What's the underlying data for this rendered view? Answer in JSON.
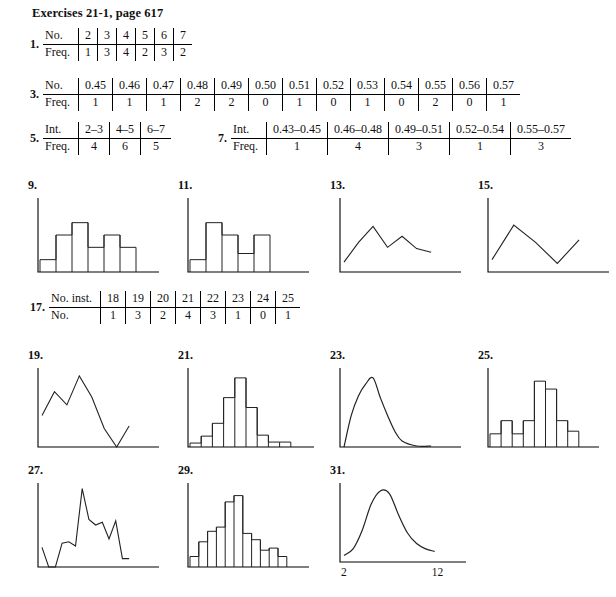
{
  "header": {
    "title": "Exercises 21-1, page 617"
  },
  "tables": [
    {
      "number": "1.",
      "x": 30,
      "y": 28,
      "rows": [
        {
          "label": "No.",
          "cells": [
            "2",
            "3",
            "4",
            "5",
            "6",
            "7"
          ]
        },
        {
          "label": "Freq.",
          "cells": [
            "1",
            "3",
            "4",
            "2",
            "3",
            "2"
          ]
        }
      ]
    },
    {
      "number": "3.",
      "x": 30,
      "y": 78,
      "rows": [
        {
          "label": "No.",
          "cells": [
            "0.45",
            "0.46",
            "0.47",
            "0.48",
            "0.49",
            "0.50",
            "0.51",
            "0.52",
            "0.53",
            "0.54",
            "0.55",
            "0.56",
            "0.57"
          ]
        },
        {
          "label": "Freq.",
          "cells": [
            "1",
            "1",
            "1",
            "2",
            "2",
            "0",
            "1",
            "0",
            "1",
            "0",
            "2",
            "0",
            "1"
          ]
        }
      ]
    },
    {
      "number": "5.",
      "x": 30,
      "y": 122,
      "rows": [
        {
          "label": "Int.",
          "cells": [
            "2–3",
            "4–5",
            "6–7"
          ]
        },
        {
          "label": "Freq.",
          "cells": [
            "4",
            "6",
            "5"
          ]
        }
      ]
    },
    {
      "number": "7.",
      "x": 218,
      "y": 122,
      "rows": [
        {
          "label": "Int.",
          "cells": [
            "0.43–0.45",
            "0.46–0.48",
            "0.49–0.51",
            "0.52–0.54",
            "0.55–0.57"
          ]
        },
        {
          "label": "Freq.",
          "cells": [
            "1",
            "4",
            "3",
            "1",
            "3"
          ]
        }
      ]
    },
    {
      "number": "17.",
      "x": 30,
      "y": 291,
      "rows": [
        {
          "label": "No. inst.",
          "cells": [
            "18",
            "19",
            "20",
            "21",
            "22",
            "23",
            "24",
            "25"
          ]
        },
        {
          "label": "No.",
          "cells": [
            "1",
            "3",
            "2",
            "4",
            "3",
            "1",
            "0",
            "1"
          ]
        }
      ]
    }
  ],
  "figures": [
    {
      "number": "9.",
      "x": 28,
      "y": 178,
      "w": 145,
      "h": 90,
      "chart_data": {
        "type": "bar",
        "title": "9.",
        "categories": [
          "1",
          "2",
          "3",
          "4",
          "5",
          "6"
        ],
        "values": [
          1,
          3,
          4,
          2,
          3,
          2
        ],
        "ylim": [
          0,
          6
        ],
        "xlabel": "",
        "ylabel": "",
        "grid": false,
        "legend": null,
        "axis_style": "L-shaped axes, no tick labels"
      }
    },
    {
      "number": "11.",
      "x": 178,
      "y": 178,
      "w": 145,
      "h": 90,
      "chart_data": {
        "type": "bar",
        "title": "11.",
        "categories": [
          "1",
          "2",
          "3",
          "4",
          "5"
        ],
        "values": [
          1,
          4,
          3,
          1.5,
          3
        ],
        "ylim": [
          0,
          6
        ],
        "xlabel": "",
        "ylabel": "",
        "grid": false,
        "legend": null,
        "axis_style": "L-shaped axes, no tick labels"
      }
    },
    {
      "number": "13.",
      "x": 330,
      "y": 178,
      "w": 145,
      "h": 90,
      "chart_data": {
        "type": "line",
        "title": "13.",
        "x": [
          0,
          1,
          2,
          3,
          4,
          5,
          6
        ],
        "values": [
          0.8,
          2.4,
          3.7,
          2.0,
          2.9,
          1.9,
          1.6
        ],
        "ylim": [
          0,
          6
        ],
        "xlabel": "",
        "ylabel": "",
        "grid": false,
        "legend": null,
        "axis_style": "frequency polygon, L-shaped axes"
      }
    },
    {
      "number": "15.",
      "x": 478,
      "y": 178,
      "w": 145,
      "h": 90,
      "chart_data": {
        "type": "line",
        "title": "15.",
        "x": [
          0,
          1,
          2,
          3,
          4
        ],
        "values": [
          1.0,
          3.8,
          2.4,
          0.7,
          2.6
        ],
        "ylim": [
          0,
          6
        ],
        "xlabel": "",
        "ylabel": "",
        "grid": false,
        "legend": null,
        "axis_style": "frequency polygon, L-shaped axes"
      }
    },
    {
      "number": "19.",
      "x": 28,
      "y": 348,
      "w": 145,
      "h": 95,
      "chart_data": {
        "type": "line",
        "title": "19.",
        "x": [
          0,
          1,
          2,
          3,
          4,
          5,
          6,
          7
        ],
        "values": [
          2.4,
          4.2,
          3.2,
          5.4,
          3.8,
          1.4,
          0.0,
          1.6
        ],
        "ylim": [
          0,
          6
        ],
        "xlabel": "",
        "ylabel": "",
        "grid": false,
        "legend": null,
        "axis_style": "frequency polygon, L-shaped axes"
      }
    },
    {
      "number": "21.",
      "x": 178,
      "y": 348,
      "w": 150,
      "h": 95,
      "chart_data": {
        "type": "bar",
        "title": "21.",
        "categories": [
          "1",
          "2",
          "3",
          "4",
          "5",
          "6",
          "7",
          "8",
          "9"
        ],
        "values": [
          0.4,
          1.1,
          2.4,
          5.0,
          7.0,
          4.0,
          1.2,
          0.5,
          0.5
        ],
        "ylim": [
          0,
          8
        ],
        "xlabel": "",
        "ylabel": "",
        "grid": false,
        "legend": null,
        "axis_style": "histogram, L-shaped axes"
      }
    },
    {
      "number": "23.",
      "x": 330,
      "y": 348,
      "w": 145,
      "h": 95,
      "chart_data": {
        "type": "line",
        "title": "23.",
        "x": [
          0,
          0.5,
          1,
          1.5,
          2,
          2.5,
          3,
          3.5,
          4,
          5,
          6
        ],
        "values": [
          0.0,
          3.2,
          5.2,
          6.4,
          7.0,
          5.0,
          3.2,
          1.6,
          0.6,
          0.1,
          0.1
        ],
        "ylim": [
          0,
          8
        ],
        "xlabel": "",
        "ylabel": "",
        "grid": false,
        "legend": null,
        "axis_style": "smooth right-skewed frequency curve"
      }
    },
    {
      "number": "25.",
      "x": 478,
      "y": 348,
      "w": 135,
      "h": 95,
      "chart_data": {
        "type": "bar",
        "title": "25.",
        "categories": [
          "1",
          "2",
          "3",
          "4",
          "5",
          "6",
          "7",
          "8"
        ],
        "values": [
          1.0,
          2.0,
          1.0,
          2.0,
          5.0,
          4.4,
          2.0,
          1.2
        ],
        "ylim": [
          0,
          6
        ],
        "xlabel": "",
        "ylabel": "",
        "grid": false,
        "legend": null,
        "axis_style": "histogram, L-shaped axes"
      }
    },
    {
      "number": "27.",
      "x": 28,
      "y": 463,
      "w": 145,
      "h": 100,
      "chart_data": {
        "type": "line",
        "title": "27.",
        "x": [
          0,
          1,
          2,
          3,
          4,
          5,
          6,
          7,
          8,
          9,
          10,
          11,
          12,
          13
        ],
        "values": [
          1.4,
          0.0,
          0.0,
          1.7,
          1.8,
          1.5,
          5.6,
          3.4,
          3.0,
          3.2,
          2.0,
          3.3,
          0.6,
          0.6
        ],
        "ylim": [
          0,
          6
        ],
        "xlabel": "",
        "ylabel": "",
        "grid": false,
        "legend": null,
        "axis_style": "jagged frequency polygon"
      }
    },
    {
      "number": "29.",
      "x": 178,
      "y": 463,
      "w": 145,
      "h": 100,
      "chart_data": {
        "type": "bar",
        "title": "29.",
        "categories": [
          "1",
          "2",
          "3",
          "4",
          "5",
          "6",
          "7",
          "8",
          "9",
          "10",
          "11"
        ],
        "values": [
          1.0,
          2.4,
          3.4,
          3.8,
          6.2,
          6.8,
          3.2,
          2.6,
          1.6,
          1.8,
          1.0
        ],
        "ylim": [
          0,
          8
        ],
        "xlabel": "",
        "ylabel": "",
        "grid": false,
        "legend": null,
        "axis_style": "histogram, L-shaped axes"
      }
    },
    {
      "number": "31.",
      "x": 330,
      "y": 463,
      "w": 150,
      "h": 105,
      "chart_data": {
        "type": "line",
        "title": "31.",
        "x": [
          2,
          3,
          4,
          5,
          6,
          7,
          8,
          9,
          10,
          11,
          12
        ],
        "values": [
          0.5,
          1.0,
          2.4,
          4.4,
          5.4,
          5.2,
          3.6,
          2.2,
          1.4,
          1.0,
          0.8
        ],
        "ylim": [
          0,
          6
        ],
        "xlim": [
          2,
          12
        ],
        "xtick_labels": [
          "2",
          "12"
        ],
        "xlabel": "",
        "ylabel": "",
        "grid": false,
        "legend": null,
        "axis_style": "smooth bell-shaped frequency curve with x ticks 2 and 12"
      }
    }
  ]
}
